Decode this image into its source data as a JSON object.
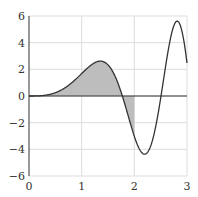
{
  "chart_data": {
    "type": "line",
    "title": "",
    "xlabel": "",
    "ylabel": "",
    "function": "f(x) = 2x·sin(x²)",
    "xlim": [
      0,
      3
    ],
    "ylim": [
      -6,
      6
    ],
    "grid": true,
    "x_ticks": [
      "0",
      "1",
      "2",
      "3"
    ],
    "y_ticks": [
      "6",
      "4",
      "2",
      "0",
      "−2",
      "−4",
      "−6"
    ],
    "x_tick_values": [
      0,
      1,
      2,
      3
    ],
    "y_tick_values": [
      6,
      4,
      2,
      0,
      -2,
      -4,
      -6
    ],
    "shaded_region": {
      "from": 0,
      "to": 2,
      "fill": "#bdbdbd"
    },
    "series": [
      {
        "name": "f(x)",
        "x": [
          0,
          0.25,
          0.5,
          0.75,
          1.0,
          1.25,
          1.36,
          1.5,
          1.75,
          1.77,
          2.0,
          2.17,
          2.25,
          2.5,
          2.51,
          2.75,
          2.86,
          3.0
        ],
        "values": [
          0,
          0.03,
          0.25,
          0.84,
          1.68,
          2.5,
          2.61,
          2.33,
          0.11,
          0,
          -3.03,
          -4.34,
          -4.28,
          -0.33,
          0,
          5.18,
          5.52,
          2.47
        ]
      }
    ],
    "colors": {
      "line": "#333333",
      "shade": "#bdbdbd",
      "grid": "#dddddd",
      "axis": "#333333"
    }
  }
}
